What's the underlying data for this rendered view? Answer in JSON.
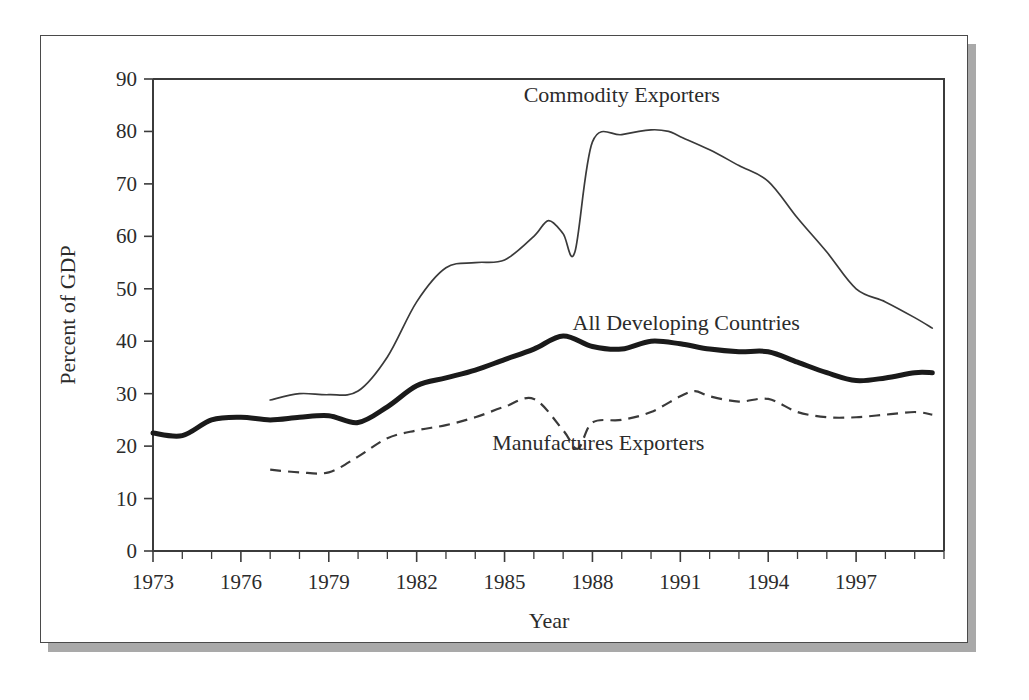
{
  "figure": {
    "frame_color": "#4a4a4a",
    "shadow_color": "#a9a9a9",
    "background": "#ffffff"
  },
  "chart_data": {
    "type": "line",
    "title": "",
    "xlabel": "Year",
    "ylabel": "Percent of GDP",
    "xlim": [
      1973,
      2000
    ],
    "ylim": [
      0,
      90
    ],
    "ytick_step": 10,
    "yticks": [
      0,
      10,
      20,
      30,
      40,
      50,
      60,
      70,
      80,
      90
    ],
    "xticks_major": [
      1973,
      1976,
      1979,
      1982,
      1985,
      1988,
      1991,
      1994,
      1997
    ],
    "xticks_minor_step": 1,
    "grid": false,
    "legend_position": "inline-annotations",
    "series": [
      {
        "name": "Commodity Exporters",
        "style": "thin-solid",
        "color": "#3a3a3a",
        "label_x": 1989.0,
        "label_y": 87.0,
        "x": [
          1977,
          1978,
          1979,
          1980,
          1981,
          1982,
          1983,
          1984,
          1985,
          1986,
          1986.5,
          1987,
          1987.4,
          1988,
          1989,
          1990,
          1990.6,
          1991,
          1992,
          1993,
          1994,
          1995,
          1996,
          1997,
          1998,
          1999,
          1999.6
        ],
        "values": [
          28.8,
          30.0,
          29.8,
          30.5,
          37.0,
          47.5,
          54.0,
          55.0,
          55.5,
          60.0,
          63.0,
          60.5,
          57.0,
          78.0,
          79.4,
          80.3,
          80.0,
          79.0,
          76.5,
          73.5,
          70.5,
          63.5,
          57.0,
          50.0,
          47.5,
          44.5,
          42.5
        ]
      },
      {
        "name": "All Developing Countries",
        "style": "bold-solid",
        "color": "#1a1a1a",
        "label_x": 1991.2,
        "label_y": 43.5,
        "x": [
          1973,
          1974,
          1975,
          1976,
          1977,
          1978,
          1979,
          1980,
          1981,
          1982,
          1983,
          1984,
          1985,
          1986,
          1987,
          1988,
          1989,
          1990,
          1991,
          1992,
          1993,
          1994,
          1995,
          1996,
          1997,
          1998,
          1999,
          1999.6
        ],
        "values": [
          22.5,
          22.0,
          25.0,
          25.5,
          25.0,
          25.5,
          25.8,
          24.5,
          27.5,
          31.5,
          33.0,
          34.5,
          36.5,
          38.5,
          41.0,
          39.0,
          38.5,
          40.0,
          39.5,
          38.5,
          38.0,
          38.0,
          36.0,
          34.0,
          32.5,
          33.0,
          34.0,
          34.0
        ]
      },
      {
        "name": "Manufactures Exporters",
        "style": "dashed",
        "color": "#3a3a3a",
        "label_x": 1988.2,
        "label_y": 20.5,
        "x": [
          1977,
          1978,
          1979,
          1980,
          1981,
          1982,
          1983,
          1984,
          1985,
          1986,
          1987,
          1987.5,
          1988,
          1989,
          1990,
          1991,
          1991.5,
          1992,
          1993,
          1994,
          1995,
          1996,
          1997,
          1998,
          1999,
          1999.6
        ],
        "values": [
          15.5,
          15.0,
          15.0,
          18.0,
          21.5,
          23.0,
          24.0,
          25.5,
          27.5,
          29.0,
          23.0,
          19.5,
          24.5,
          25.0,
          26.5,
          29.5,
          30.5,
          29.5,
          28.5,
          29.0,
          26.5,
          25.5,
          25.5,
          26.0,
          26.5,
          26.0
        ]
      }
    ]
  }
}
